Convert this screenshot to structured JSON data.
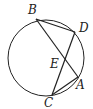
{
  "diagram": {
    "type": "circle-geometry",
    "circle": {
      "cx": 46,
      "cy": 58,
      "r": 38
    },
    "points": {
      "B": {
        "x": 36,
        "y": 19,
        "label": "B",
        "lx": 28,
        "ly": 14
      },
      "D": {
        "x": 75,
        "y": 32,
        "label": "D",
        "lx": 79,
        "ly": 32
      },
      "A": {
        "x": 78,
        "y": 77,
        "label": "A",
        "lx": 76,
        "ly": 89
      },
      "C": {
        "x": 52,
        "y": 95,
        "label": "C",
        "lx": 44,
        "ly": 107
      },
      "E": {
        "x": 64,
        "y": 66,
        "label": "E",
        "lx": 50,
        "ly": 66
      }
    },
    "segments": [
      [
        "B",
        "D"
      ],
      [
        "B",
        "A"
      ],
      [
        "D",
        "C"
      ],
      [
        "C",
        "A"
      ]
    ],
    "line_color": "#222222"
  }
}
